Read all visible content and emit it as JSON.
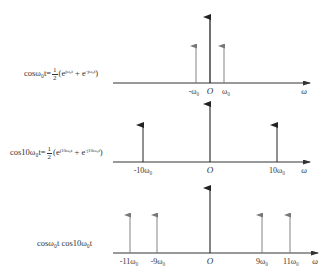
{
  "panels": [
    {
      "id": "cos-w0",
      "formula": {
        "lhs": "cosω₀t",
        "equals": "=",
        "frac_num": "1",
        "frac_den": "2",
        "rhs": "(e^{jω₀t} + e^{-jω₀t})",
        "rhs_open": "(e",
        "rhs_exp1": "jω₀t",
        "rhs_plus": " + e",
        "rhs_exp2": "-jω₀t",
        "rhs_close": ")"
      },
      "axis_label": "ω",
      "origin_label": "O",
      "tick_labels": [
        "-ω₀",
        "O",
        "ω₀"
      ],
      "impulses": [
        {
          "position": "-ω0",
          "label": "-ω₀",
          "weight": "half"
        },
        {
          "position": "ω0",
          "label": "ω₀",
          "weight": "half"
        }
      ]
    },
    {
      "id": "cos-10w0",
      "formula": {
        "lhs": "cos10ω₀t",
        "equals": "=",
        "frac_num": "1",
        "frac_den": "2",
        "rhs_open": "(e",
        "rhs_exp1": "j10ω₀t",
        "rhs_plus": " + e",
        "rhs_exp2": "-j10ω₀t",
        "rhs_close": ")"
      },
      "axis_label": "ω",
      "origin_label": "O",
      "tick_labels": [
        "-10ω₀",
        "O",
        "10ω₀"
      ],
      "impulses": [
        {
          "position": "-10ω0",
          "label": "-10ω₀",
          "weight": "half"
        },
        {
          "position": "10ω0",
          "label": "10ω₀",
          "weight": "half"
        }
      ]
    },
    {
      "id": "product",
      "formula": {
        "lhs": "cosω₀t cos10ω₀t"
      },
      "axis_label": "ω",
      "origin_label": "O",
      "tick_labels": [
        "-11ω₀",
        "-9ω₀",
        "O",
        "9ω₀",
        "11ω₀"
      ],
      "impulses": [
        {
          "position": "-11ω0",
          "label": "-11ω₀",
          "weight": "quarter"
        },
        {
          "position": "-9ω0",
          "label": "-9ω₀",
          "weight": "quarter"
        },
        {
          "position": "9ω0",
          "label": "9ω₀",
          "weight": "quarter"
        },
        {
          "position": "11ω0",
          "label": "11ω₀",
          "weight": "quarter"
        }
      ]
    }
  ],
  "colors": {
    "axis": "#333333",
    "impulse_dark": "#222222",
    "impulse_light": "#777777",
    "background": "#ffffff"
  }
}
